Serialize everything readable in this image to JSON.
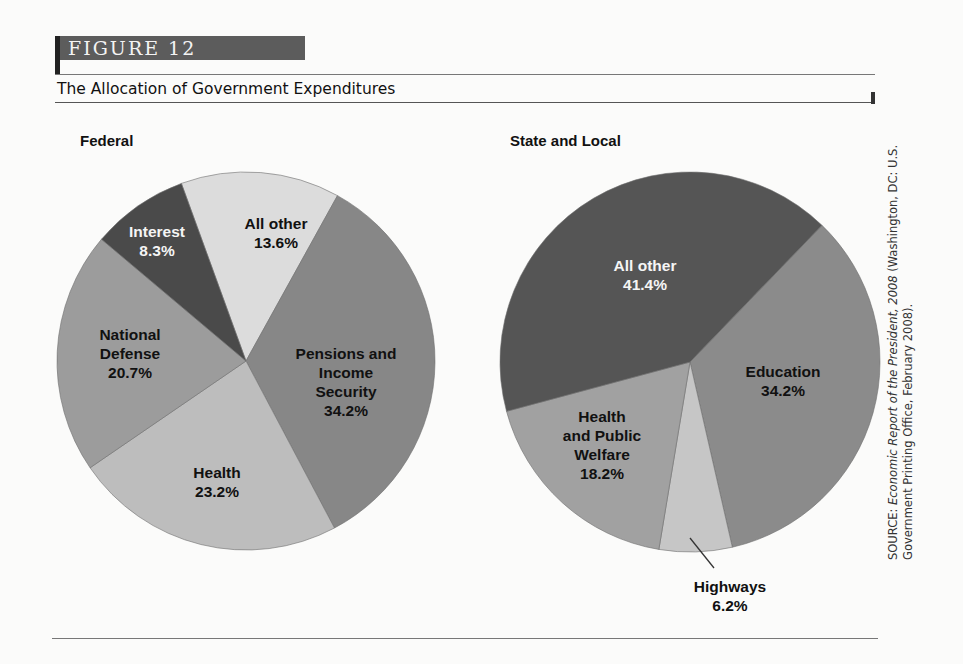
{
  "figure": {
    "number_label": "FIGURE 12",
    "title": "The Allocation of Government Expenditures",
    "source_prefix": "SOURCE: ",
    "source_italic": "Economic Report of the President, 2008",
    "source_rest_line1": " (Washington, DC: U.S.",
    "source_line2": "Government Printing Office, February 2008)."
  },
  "chart_data": [
    {
      "type": "pie",
      "title": "Federal",
      "categories": [
        "All other",
        "Pensions and Income Security",
        "Health",
        "National Defense",
        "Interest"
      ],
      "values": [
        13.6,
        34.2,
        23.2,
        20.7,
        8.3
      ],
      "unit": "%",
      "colors": [
        "#dcdcdc",
        "#878787",
        "#bdbdbd",
        "#9c9c9c",
        "#4a4a4a"
      ],
      "start_angle_deg": -20,
      "direction": "clockwise"
    },
    {
      "type": "pie",
      "title": "State and Local",
      "categories": [
        "Education",
        "Highways",
        "Health and Public Welfare",
        "All other"
      ],
      "values": [
        34.2,
        6.2,
        18.2,
        41.4
      ],
      "unit": "%",
      "colors": [
        "#8b8b8b",
        "#c6c6c6",
        "#a1a1a1",
        "#555555"
      ],
      "start_angle_deg": 44,
      "direction": "clockwise"
    }
  ],
  "labels": {
    "federal": {
      "all_other": {
        "name": "All other",
        "value": "13.6%"
      },
      "pensions": {
        "line1": "Pensions and",
        "line2": "Income",
        "line3": "Security",
        "value": "34.2%"
      },
      "health": {
        "name": "Health",
        "value": "23.2%"
      },
      "defense": {
        "line1": "National",
        "line2": "Defense",
        "value": "20.7%"
      },
      "interest": {
        "name": "Interest",
        "value": "8.3%"
      }
    },
    "state": {
      "all_other": {
        "name": "All other",
        "value": "41.4%"
      },
      "education": {
        "name": "Education",
        "value": "34.2%"
      },
      "welfare": {
        "line1": "Health",
        "line2": "and Public",
        "line3": "Welfare",
        "value": "18.2%"
      },
      "highways": {
        "name": "Highways",
        "value": "6.2%"
      }
    }
  }
}
